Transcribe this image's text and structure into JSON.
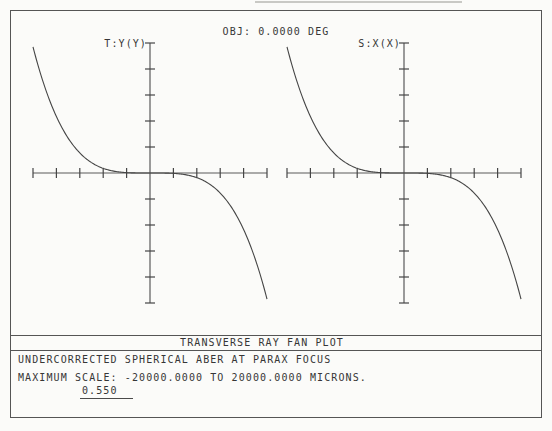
{
  "header": {
    "obj_label": "OBJ: 0.0000 DEG"
  },
  "plots": [
    {
      "id": "tangential",
      "label": "T:Y(Y)"
    },
    {
      "id": "sagittal",
      "label": "S:X(X)"
    }
  ],
  "footer": {
    "band_title": "TRANSVERSE RAY FAN PLOT",
    "description": "UNDERCORRECTED SPHERICAL ABER AT PARAX FOCUS",
    "scale_line": "MAXIMUM SCALE: -20000.0000 TO 20000.0000 MICRONS.",
    "wavelength": "0.550"
  },
  "colors": {
    "background": "#fbfbf9",
    "line": "#5a5a5a",
    "tick": "#454545",
    "curve": "#454545",
    "text": "#363636"
  },
  "chart_data": {
    "type": "line",
    "title": "TRANSVERSE RAY FAN PLOT",
    "subtitle": "UNDERCORRECTED SPHERICAL ABER AT PARAX FOCUS",
    "obj_angle_deg": 0.0,
    "xlabel": "normalized pupil coordinate",
    "ylabel": "transverse ray aberration (microns)",
    "xlim": [
      -1,
      1
    ],
    "ylim": [
      -20000,
      20000
    ],
    "x_tick_interval": 0.2,
    "y_tick_interval_microns": 4000,
    "grid": false,
    "legend_position": "bottom-left",
    "legend_entries": [
      "0.550"
    ],
    "subplots": [
      {
        "id": "tangential",
        "axis_label": "T:Y(Y)",
        "x_meaning": "pupil Py",
        "y_meaning": "ey (microns)"
      },
      {
        "id": "sagittal",
        "axis_label": "S:X(X)",
        "x_meaning": "pupil Px",
        "y_meaning": "ex (microns)"
      }
    ],
    "model": {
      "amplitude_microns": -19400,
      "exponent": 3.6
    },
    "x": [
      -1.0,
      -0.9,
      -0.8,
      -0.7,
      -0.6,
      -0.5,
      -0.4,
      -0.3,
      -0.2,
      -0.1,
      0,
      0.1,
      0.2,
      0.3,
      0.4,
      0.5,
      0.6,
      0.7,
      0.8,
      0.9,
      1.0
    ],
    "series": [
      {
        "name": "0.550 microns (both fans)",
        "values": [
          19400,
          13280,
          8690,
          5370,
          3080,
          1600,
          720,
          250,
          60,
          5,
          0,
          -5,
          -60,
          -250,
          -720,
          -1600,
          -3080,
          -5370,
          -8690,
          -13280,
          -19400
        ]
      }
    ]
  }
}
